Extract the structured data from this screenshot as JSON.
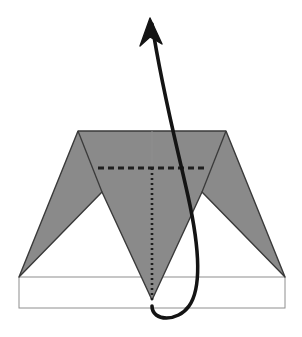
{
  "figure": {
    "title": "Folded paper dart diagram with upward curved motion arrow",
    "canvas": {
      "width": 302,
      "height": 337,
      "background": "#ffffff"
    },
    "colors": {
      "fill_gray": "#8a8a8a",
      "outline_dark": "#3a3a3a",
      "outline_thin_gray": "#8e8e8e",
      "arrow_black": "#141414",
      "paper_white": "#ffffff"
    },
    "shapes": {
      "dart_body": {
        "name": "dart-body",
        "description": "Gray swept-wing dart outline",
        "points": "78,131 226,131 285,277 202,192 152,300 102,192 19,277"
      },
      "base_rectangle": {
        "name": "base-rectangle",
        "description": "Thin outlined rectangle forming the ground plane",
        "x": 19,
        "y": 277,
        "width": 266,
        "height": 31
      },
      "fold_line_dashed": {
        "name": "fold-line-dashed",
        "description": "Bold horizontal dashed crease line",
        "x1": 98,
        "y1": 168,
        "x2": 206,
        "y2": 168,
        "stroke_width": 3.2,
        "dash_pattern": "6 4"
      },
      "center_line_dotted": {
        "name": "center-line-dotted",
        "description": "Vertical dotted center fold below the crease",
        "x1": 152,
        "y1": 168,
        "x2": 152,
        "y2": 301,
        "stroke_width": 2.6,
        "dash_pattern": "2 3"
      },
      "center_line_thin": {
        "name": "center-line-thin",
        "description": "Thin gray vertical center line above the crease",
        "x1": 152,
        "y1": 131,
        "x2": 152,
        "y2": 168,
        "stroke_width": 1
      },
      "motion_arrow": {
        "name": "motion-arrow",
        "description": "Bold curved arrow looping from base apex up and to the left",
        "path": "M 152,306 C 152,322 178,322 189,306 C 202,288 200,250 188,196 C 176,142 162,90 152,24",
        "stroke_width": 3.6,
        "head_tip": "150,18",
        "head_points": "150,18 162,44 150,37 140,46"
      }
    }
  }
}
